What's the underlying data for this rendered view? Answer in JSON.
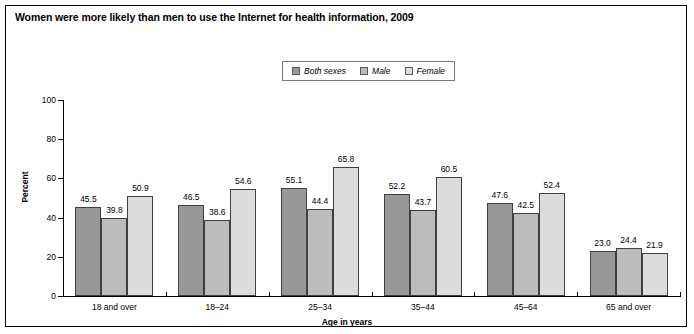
{
  "figure": {
    "title": "Women were more likely than men to use the Internet for health information, 2009"
  },
  "legend": {
    "items": [
      {
        "label": "Both sexes",
        "color": "#989898"
      },
      {
        "label": "Male",
        "color": "#bcbcbc"
      },
      {
        "label": "Female",
        "color": "#dcdcdc"
      }
    ]
  },
  "axes": {
    "ylabel": "Percent",
    "xlabel": "Age in years",
    "yticks": [
      "0",
      "20",
      "40",
      "60",
      "80",
      "100"
    ]
  },
  "chart_data": {
    "type": "bar",
    "title": "Women were more likely than men to use the Internet for health information, 2009",
    "xlabel": "Age in years",
    "ylabel": "Percent",
    "ylim": [
      0,
      100
    ],
    "ytick_values": [
      0,
      20,
      40,
      60,
      80,
      100
    ],
    "grid": false,
    "legend_position": "top-center",
    "categories": [
      "18 and over",
      "18–24",
      "25–34",
      "35–44",
      "45–64",
      "65 and over"
    ],
    "series": [
      {
        "name": "Both sexes",
        "color": "#989898",
        "values": [
          45.5,
          46.5,
          55.1,
          52.2,
          47.6,
          23.0
        ]
      },
      {
        "name": "Male",
        "color": "#bcbcbc",
        "values": [
          39.8,
          38.6,
          44.4,
          43.7,
          42.5,
          24.4
        ]
      },
      {
        "name": "Female",
        "color": "#dcdcdc",
        "values": [
          50.9,
          54.6,
          65.8,
          60.5,
          52.4,
          21.9
        ]
      }
    ],
    "value_labels": [
      [
        "45.5",
        "39.8",
        "50.9"
      ],
      [
        "46.5",
        "38.6",
        "54.6"
      ],
      [
        "55.1",
        "44.4",
        "65.8"
      ],
      [
        "52.2",
        "43.7",
        "60.5"
      ],
      [
        "47.6",
        "42.5",
        "52.4"
      ],
      [
        "23.0",
        "24.4",
        "21.9"
      ]
    ]
  }
}
